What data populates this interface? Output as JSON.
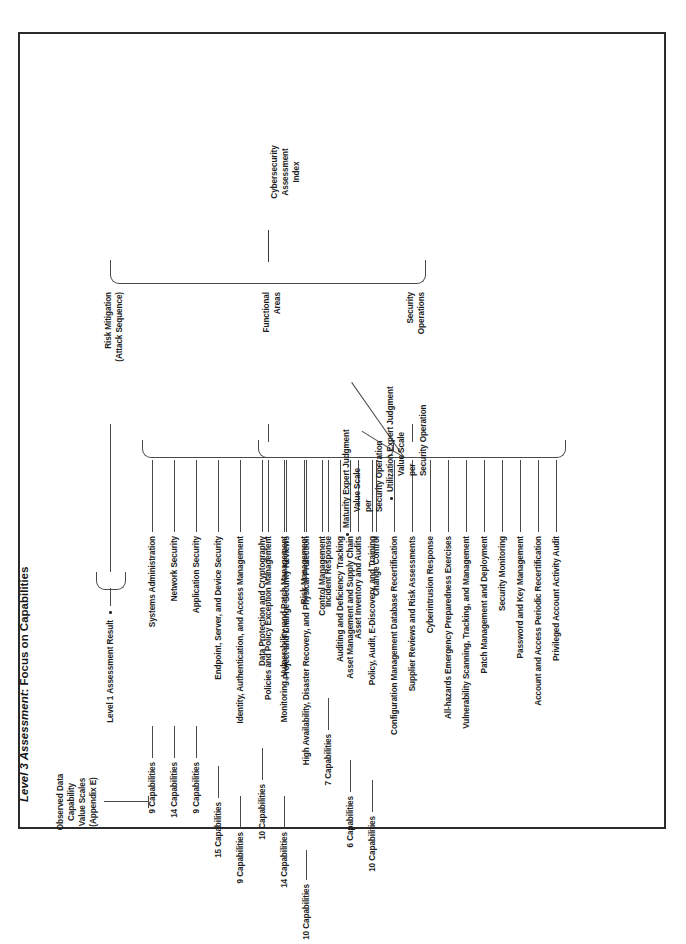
{
  "figure": {
    "title_italic": "Level 3 Assessment",
    "title_rest": ": Focus on Capabilities"
  },
  "root": {
    "label": "Cybersecurity Assessment Index",
    "label_lines": [
      "Cybersecurity",
      "Assessment",
      "Index"
    ]
  },
  "branches": {
    "risk_mitigation": {
      "label_lines": [
        "Risk Mitigation",
        "(Attack Sequence)"
      ],
      "leaf": "Level 1 Assessment Result",
      "leaf_bullet": "•"
    },
    "functional_areas": {
      "label_lines": [
        "Functional",
        "Areas"
      ],
      "scale_note_lines": [
        "Observed Data",
        "Capability",
        "Value Scales",
        "(Appendix E)"
      ],
      "items": [
        {
          "name": "Systems Administration",
          "count": "9 Capabilities"
        },
        {
          "name": "Network Security",
          "count": "14 Capabilities"
        },
        {
          "name": "Application Security",
          "count": "9 Capabilities"
        },
        {
          "name": "Endpoint, Server, and Device Security",
          "count": "15 Capabilities"
        },
        {
          "name": "Identity, Authentication, and Access Management",
          "count": "9 Capabilities"
        },
        {
          "name": "Data Protection and Cryptography",
          "count": "10 Capabilities"
        },
        {
          "name": "Monitoring, Vulnerability, and Patch Management",
          "count": "14 Capabilities"
        },
        {
          "name": "High Availability, Disaster Recovery, and Physical Protection",
          "count": "10 Capabilities"
        },
        {
          "name": "Incident Response",
          "count": "7 Capabilities"
        },
        {
          "name": "Asset Management and Supply Chain",
          "count": "6 Capabilities"
        },
        {
          "name": "Policy, Audit, E-Discovery, and Training",
          "count": "10 Capabilities"
        }
      ]
    },
    "security_operations": {
      "label_lines": [
        "Security",
        "Operations"
      ],
      "notes": [
        {
          "bullet": "•",
          "italic": "Maturity",
          "rest": " Expert Judgment",
          "lines": [
            "Value Scale",
            "per",
            "Security Operation"
          ]
        },
        {
          "bullet": "•",
          "italic": "Utilization",
          "rest": " Expert Judgment",
          "lines": [
            "Value Scale",
            "per",
            "Security Operation"
          ]
        }
      ],
      "items": [
        "Policies and Policy Exception Management",
        "Project and Change Security Reviews",
        "Risk Management",
        "Control Management",
        "Auditing and Deficiency Tracking",
        "Asset Inventory and Audits",
        "Change Control",
        "Configuration Management Database Recertification",
        "Supplier Reviews and Risk Assessments",
        "Cyberintrusion Response",
        "All-hazards Emergency Preparedness Exercises",
        "Vulnerability Scanning, Tracking, and Management",
        "Patch Management and Deployment",
        "Security Monitoring",
        "Password and Key Management",
        "Account and Access Periodic Recertification",
        "Privileged Account Activity Audit"
      ]
    }
  }
}
